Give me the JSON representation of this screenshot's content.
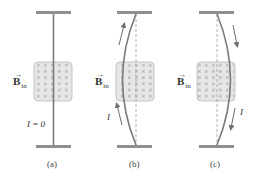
{
  "figure": {
    "colors": {
      "bar": "#8f8f8f",
      "wire": "#7a7a7a",
      "field_fill": "#e6e6e6",
      "field_border": "#b8b8b8",
      "field_mark": "#9a9a9a",
      "dashed": "#a0a0a0",
      "arrow": "#6e6e6e",
      "text": "#333333"
    },
    "field_label": {
      "symbol": "B",
      "vector_mark": "→",
      "subscript": "in"
    },
    "panels": [
      {
        "id": "a",
        "caption": "(a)",
        "current_label": "I = 0",
        "wire_shape": "straight",
        "current_direction": "none"
      },
      {
        "id": "b",
        "caption": "(b)",
        "current_label": "I",
        "wire_shape": "bowed-left",
        "current_direction": "up"
      },
      {
        "id": "c",
        "caption": "(c)",
        "current_label": "I",
        "wire_shape": "bowed-right",
        "current_direction": "down"
      }
    ],
    "field_grid": {
      "rows": 6,
      "cols": 5,
      "mark": "×"
    }
  }
}
